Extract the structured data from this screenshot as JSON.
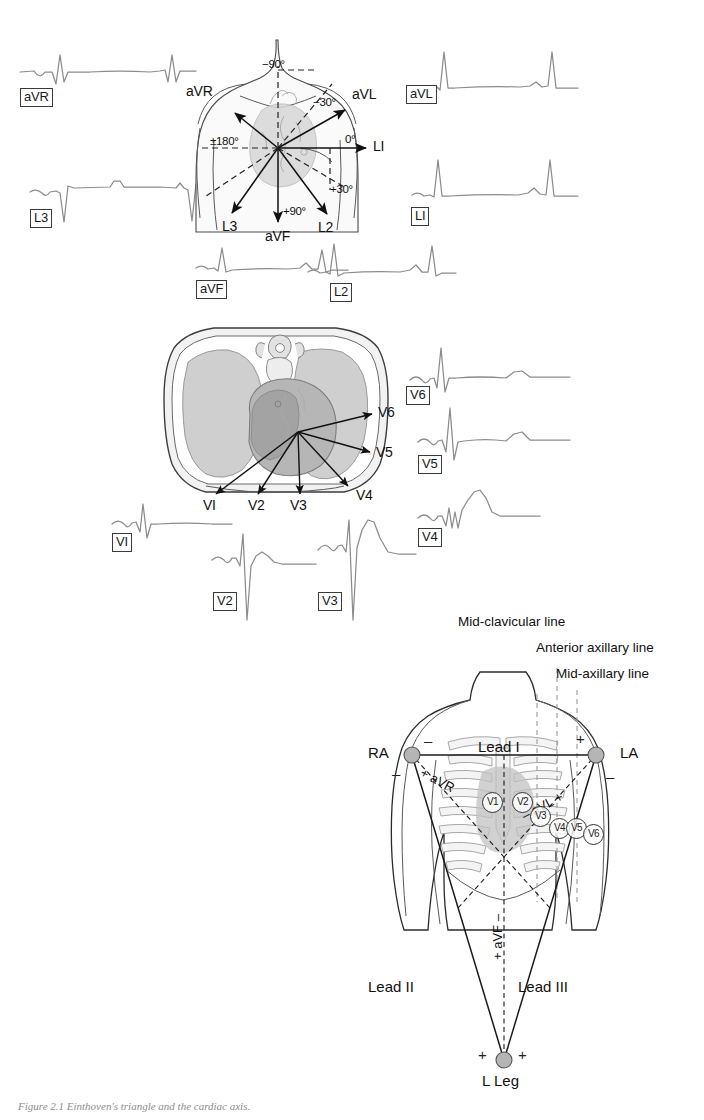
{
  "figure": {
    "caption": "Figure 2.1  Einthoven's triangle and the cardiac axis."
  },
  "panel_limb": {
    "name": "limb-lead-axis-panel",
    "traces": [
      {
        "id": "aVR",
        "label": "aVR"
      },
      {
        "id": "aVL",
        "label": "aVL"
      },
      {
        "id": "L3",
        "label": "L3"
      },
      {
        "id": "L1",
        "label": "LI"
      },
      {
        "id": "aVF",
        "label": "aVF"
      },
      {
        "id": "L2",
        "label": "L2"
      }
    ],
    "vectors": [
      {
        "id": "aVR",
        "label": "aVR"
      },
      {
        "id": "aVL",
        "label": "aVL"
      },
      {
        "id": "L1",
        "label": "LI"
      },
      {
        "id": "L2",
        "label": "L2"
      },
      {
        "id": "L3",
        "label": "L3"
      },
      {
        "id": "aVF",
        "label": "aVF"
      }
    ],
    "angles": [
      {
        "id": "minus90",
        "label": "−90°"
      },
      {
        "id": "minus30",
        "label": "−30°"
      },
      {
        "id": "zero",
        "label": "0°"
      },
      {
        "id": "plus30",
        "label": "+30°"
      },
      {
        "id": "plus90",
        "label": "+90°"
      },
      {
        "id": "plusminus180",
        "label": "±180°"
      }
    ]
  },
  "panel_chest": {
    "name": "chest-cross-section-panel",
    "arrow_labels": [
      {
        "id": "V6",
        "label": "V6"
      },
      {
        "id": "V5",
        "label": "V5"
      },
      {
        "id": "V4",
        "label": "V4"
      },
      {
        "id": "V3",
        "label": "V3"
      },
      {
        "id": "V2",
        "label": "V2"
      },
      {
        "id": "V1",
        "label": "VI"
      }
    ],
    "traces": [
      {
        "id": "V6",
        "label": "V6"
      },
      {
        "id": "V5",
        "label": "V5"
      },
      {
        "id": "V4",
        "label": "V4"
      },
      {
        "id": "V1",
        "label": "VI"
      },
      {
        "id": "V2",
        "label": "V2"
      },
      {
        "id": "V3",
        "label": "V3"
      }
    ]
  },
  "panel_einthoven": {
    "name": "einthoven-triangle-panel",
    "guide_lines": [
      {
        "id": "mid-clavicular",
        "label": "Mid-clavicular line"
      },
      {
        "id": "anterior-axillary",
        "label": "Anterior axillary line"
      },
      {
        "id": "mid-axillary",
        "label": "Mid-axillary line"
      }
    ],
    "electrodes": [
      {
        "id": "RA",
        "label": "RA"
      },
      {
        "id": "LA",
        "label": "LA"
      },
      {
        "id": "LLeg",
        "label": "L Leg"
      }
    ],
    "leads": [
      {
        "id": "lead1",
        "label": "Lead I"
      },
      {
        "id": "lead2",
        "label": "Lead II"
      },
      {
        "id": "lead3",
        "label": "Lead III"
      }
    ],
    "augmented": [
      {
        "id": "aVR",
        "label": "+ aVR"
      },
      {
        "id": "aVL",
        "label": "– aVL +"
      },
      {
        "id": "aVF",
        "label": "+ aVF –"
      }
    ],
    "polarity": {
      "ra_top": "–",
      "ra_left": "–",
      "la_top": "+",
      "la_right": "–",
      "lleg_left": "+",
      "lleg_right": "+"
    },
    "chest_electrodes": [
      {
        "id": "V1",
        "label": "V1"
      },
      {
        "id": "V2",
        "label": "V2"
      },
      {
        "id": "V3",
        "label": "V3"
      },
      {
        "id": "V4",
        "label": "V4"
      },
      {
        "id": "V5",
        "label": "V5"
      },
      {
        "id": "V6",
        "label": "V6"
      }
    ]
  },
  "colors": {
    "ink": "#1a1a1a",
    "trace": "#8c8c8c",
    "lung": "#cfcfcf",
    "heart": "#b6b6b6",
    "electrode": "#b5b5b5",
    "guide": "#9a9a9a"
  }
}
